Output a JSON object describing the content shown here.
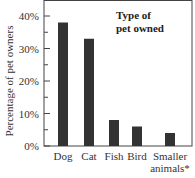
{
  "chart_data": {
    "type": "bar",
    "title": "Type of pet owned",
    "title_lines": [
      "Type of",
      "pet owned"
    ],
    "xlabel": "",
    "ylabel": "Percentage of pet owners",
    "categories": [
      "Dog",
      "Cat",
      "Fish",
      "Bird",
      "Smaller animals*"
    ],
    "category_lines": [
      [
        "Dog"
      ],
      [
        "Cat"
      ],
      [
        "Fish"
      ],
      [
        "Bird"
      ],
      [
        "Smaller",
        "animals*"
      ]
    ],
    "values": [
      38,
      33,
      8,
      6,
      4
    ],
    "ylim": [
      0,
      40
    ],
    "yticks": [
      0,
      10,
      20,
      30,
      40
    ],
    "ytick_labels": [
      "0%",
      "10%",
      "20%",
      "30%",
      "40%"
    ],
    "grid": false,
    "bar_color": "#333333",
    "title_placement": "top-right"
  }
}
